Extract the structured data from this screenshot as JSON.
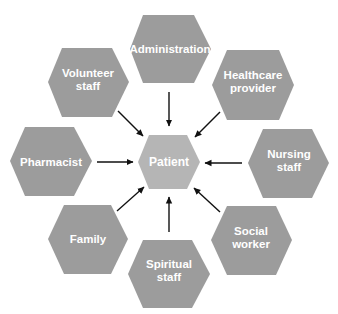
{
  "diagram": {
    "colors": {
      "outer_hex": "#9c9c9c",
      "center_hex": "#b5b5b5",
      "label": "#ffffff",
      "arrow": "#111111",
      "background": "#ffffff"
    },
    "center": {
      "label_lines": [
        "Patient"
      ],
      "points": "149,135 187,135 200,162 187,189 149,189 138,162",
      "label_x": 169,
      "label_y": 166
    },
    "nodes": [
      {
        "id": "administration",
        "label_lines": [
          "Administration"
        ],
        "points": "143,15 194,15 211,49 194,83 143,83 130,49",
        "label_x": 170,
        "label_y": 53,
        "arrow": {
          "x1": 169,
          "y1": 92,
          "x2": 169,
          "y2": 126
        }
      },
      {
        "id": "volunteer-staff",
        "label_lines": [
          "Volunteer",
          "staff"
        ],
        "points": "62,48 112,48 129,82 112,117 62,117 48,82",
        "label_x": 88,
        "label_y": 79,
        "arrow": {
          "x1": 118,
          "y1": 111,
          "x2": 143,
          "y2": 136
        }
      },
      {
        "id": "healthcare-provider",
        "label_lines": [
          "Healthcare",
          "provider"
        ],
        "points": "227,50 279,50 294,85 279,120 227,120 212,85",
        "label_x": 253,
        "label_y": 81,
        "arrow": {
          "x1": 220,
          "y1": 112,
          "x2": 195,
          "y2": 137
        }
      },
      {
        "id": "pharmacist",
        "label_lines": [
          "Pharmacist"
        ],
        "points": "25,127 74,127 92,161 74,196 25,196 10,161",
        "label_x": 51,
        "label_y": 166,
        "arrow": {
          "x1": 97,
          "y1": 162,
          "x2": 133,
          "y2": 162
        }
      },
      {
        "id": "nursing-staff",
        "label_lines": [
          "Nursing",
          "staff"
        ],
        "points": "263,129 312,129 329,163 312,198 263,198 248,163",
        "label_x": 289,
        "label_y": 160,
        "arrow": {
          "x1": 242,
          "y1": 163,
          "x2": 205,
          "y2": 163
        }
      },
      {
        "id": "family",
        "label_lines": [
          "Family"
        ],
        "points": "64,205 111,205 128,239 111,274 64,274 48,239",
        "label_x": 88,
        "label_y": 243,
        "arrow": {
          "x1": 117,
          "y1": 211,
          "x2": 144,
          "y2": 187
        }
      },
      {
        "id": "spiritual-staff",
        "label_lines": [
          "Spiritual",
          "staff"
        ],
        "points": "143,240 192,240 210,274 192,308 143,308 128,274",
        "label_x": 169,
        "label_y": 270,
        "arrow": {
          "x1": 169,
          "y1": 232,
          "x2": 169,
          "y2": 197
        }
      },
      {
        "id": "social-worker",
        "label_lines": [
          "Social",
          "worker"
        ],
        "points": "227,206 276,206 292,240 276,275 227,275 211,240",
        "label_x": 251,
        "label_y": 237,
        "arrow": {
          "x1": 220,
          "y1": 212,
          "x2": 194,
          "y2": 188
        }
      }
    ]
  }
}
